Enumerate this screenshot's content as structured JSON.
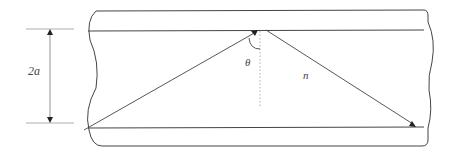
{
  "diagram": {
    "type": "optical waveguide / step-index fiber ray path",
    "labels": {
      "core_width": "2a",
      "angle": "θ",
      "refractive_index": "n"
    },
    "colors": {
      "line": "#333333",
      "dim_line": "#888888",
      "background": "#ffffff"
    }
  }
}
